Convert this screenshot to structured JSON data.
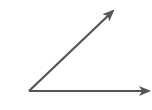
{
  "diagram": {
    "type": "angle",
    "stroke_color": "#555555",
    "background": "#ffffff",
    "vertex": {
      "x": 29,
      "y": 91
    },
    "rays": [
      {
        "name": "upper-ray",
        "from": {
          "x": 29,
          "y": 91
        },
        "to": {
          "x": 113,
          "y": 11
        }
      },
      {
        "name": "horizontal-ray",
        "from": {
          "x": 29,
          "y": 91
        },
        "to": {
          "x": 149,
          "y": 91
        }
      }
    ]
  }
}
